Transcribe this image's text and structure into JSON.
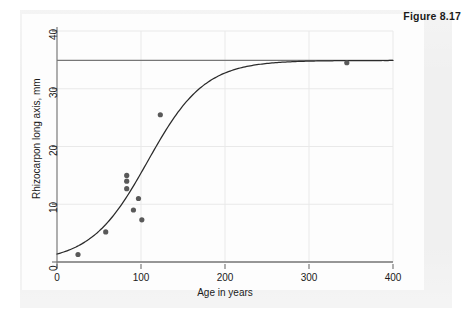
{
  "figure": {
    "caption": "Figure 8.17"
  },
  "chart_data": {
    "type": "scatter",
    "title": "",
    "xlabel": "Age in years",
    "ylabel": "Rhizocarpon long axis, mm",
    "xlim": [
      0,
      400
    ],
    "ylim": [
      0,
      40
    ],
    "xticks": [
      0,
      100,
      200,
      300,
      400
    ],
    "yticks": [
      0,
      10,
      20,
      30,
      40
    ],
    "xticklabels": [
      "0",
      "100",
      "200",
      "300",
      "400"
    ],
    "yticklabels": [
      "0",
      "10",
      "20",
      "30",
      "40"
    ],
    "grid": "faint gridlines at x ticks and y ticks",
    "legend": "none",
    "points": [
      {
        "x": 25,
        "y": 1.3
      },
      {
        "x": 58,
        "y": 5.2
      },
      {
        "x": 83,
        "y": 15.0
      },
      {
        "x": 83,
        "y": 14.0
      },
      {
        "x": 83,
        "y": 12.7
      },
      {
        "x": 97,
        "y": 11.0
      },
      {
        "x": 91,
        "y": 9.0
      },
      {
        "x": 101,
        "y": 7.3
      },
      {
        "x": 123,
        "y": 25.5
      },
      {
        "x": 345,
        "y": 34.5
      }
    ],
    "series": [
      {
        "name": "fitted growth curve",
        "type": "line",
        "model": "logistic / sigmoid fit",
        "asymptote": 34.9,
        "midpoint_x": 108,
        "rate": 0.0295
      },
      {
        "name": "upper asymptote reference line",
        "type": "hline",
        "value": 34.9
      },
      {
        "name": "baseline reference line",
        "type": "hline",
        "value": 0
      }
    ],
    "annotations": []
  },
  "colors": {
    "point": "#595959",
    "curve": "#2b2b2b",
    "axis": "#6e6e6e",
    "grid": "#e9e9e9",
    "text": "#1a1a1a",
    "page": "#f0f0f0",
    "plot_bg": "#fdfdfd"
  }
}
